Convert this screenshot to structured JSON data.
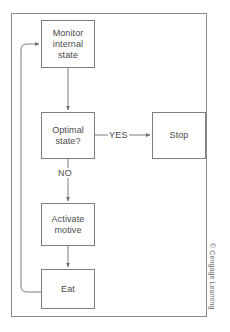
{
  "figure": {
    "frame_color": "#8a8a8a",
    "line_color": "#7d7d7d",
    "text_color": "#4a4a4a",
    "background": "#ffffff"
  },
  "nodes": [
    {
      "id": "monitor",
      "label": "Monitor\ninternal\nstate",
      "shape": "rectangle"
    },
    {
      "id": "optimal",
      "label": "Optimal\nstate?",
      "shape": "rectangle"
    },
    {
      "id": "stop",
      "label": "Stop",
      "shape": "rectangle"
    },
    {
      "id": "activate",
      "label": "Activate\nmotive",
      "shape": "rectangle"
    },
    {
      "id": "eat",
      "label": "Eat",
      "shape": "rectangle"
    }
  ],
  "edges": [
    {
      "from": "monitor",
      "to": "optimal",
      "label": ""
    },
    {
      "from": "optimal",
      "to": "stop",
      "label": "YES"
    },
    {
      "from": "optimal",
      "to": "activate",
      "label": "NO"
    },
    {
      "from": "activate",
      "to": "eat",
      "label": ""
    },
    {
      "from": "eat",
      "to": "monitor",
      "label": ""
    }
  ],
  "labels": {
    "yes": "YES",
    "no": "NO"
  },
  "credit": {
    "text": "© Cengage Learning"
  }
}
